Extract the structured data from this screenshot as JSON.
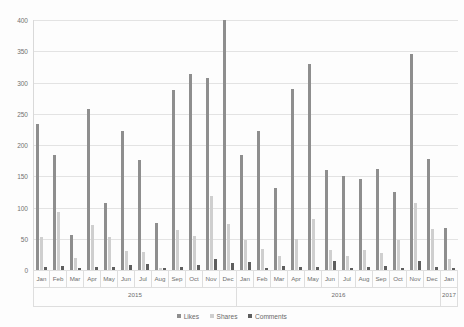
{
  "chart_data": {
    "type": "bar",
    "title": "",
    "subtitle": "",
    "xlabel": "",
    "ylabel": "",
    "ylim": [
      0,
      400
    ],
    "ytick_step": 50,
    "yticks": [
      0,
      50,
      100,
      150,
      200,
      250,
      300,
      350,
      400
    ],
    "grid": true,
    "legend_position": "bottom",
    "categories": [
      "Jan",
      "Feb",
      "Mar",
      "Apr",
      "May",
      "Jun",
      "Jul",
      "Aug",
      "Sep",
      "Oct",
      "Nov",
      "Dec",
      "Jan",
      "Feb",
      "Mar",
      "Apr",
      "May",
      "Jun",
      "Jul",
      "Aug",
      "Sep",
      "Oct",
      "Nov",
      "Dec",
      "Jan"
    ],
    "category_groups": [
      {
        "label": "2015",
        "span": 12
      },
      {
        "label": "2016",
        "span": 12
      },
      {
        "label": "2017",
        "span": 1
      }
    ],
    "series": [
      {
        "name": "Likes",
        "color": "#8e8e8e",
        "values": [
          234,
          184,
          56,
          257,
          107,
          223,
          176,
          75,
          288,
          313,
          307,
          400,
          184,
          223,
          131,
          289,
          330,
          160,
          151,
          145,
          162,
          125,
          346,
          178,
          68
        ]
      },
      {
        "name": "Shares",
        "color": "#cfcfcf",
        "values": [
          53,
          93,
          19,
          72,
          53,
          30,
          29,
          3,
          64,
          55,
          118,
          74,
          48,
          33,
          22,
          49,
          82,
          32,
          23,
          32,
          28,
          48,
          108,
          65,
          17
        ]
      },
      {
        "name": "Comments",
        "color": "#5e5e5e",
        "values": [
          5,
          6,
          4,
          5,
          5,
          8,
          9,
          3,
          5,
          8,
          18,
          12,
          13,
          4,
          6,
          5,
          5,
          14,
          4,
          5,
          7,
          4,
          15,
          5,
          3
        ]
      }
    ]
  },
  "legend": {
    "items": [
      {
        "label": "Likes",
        "color": "#8e8e8e"
      },
      {
        "label": "Shares",
        "color": "#cfcfcf"
      },
      {
        "label": "Comments",
        "color": "#5e5e5e"
      }
    ]
  }
}
